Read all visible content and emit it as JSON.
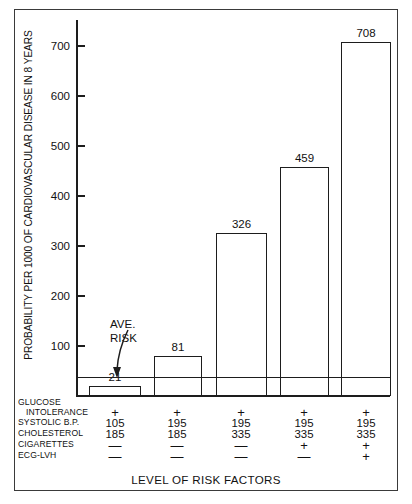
{
  "chart_data": {
    "type": "bar",
    "title": "",
    "ylabel": "PROBABILITY PER 1000 OF CARDIOVASCULAR DISEASE IN 8 YEARS",
    "xlabel": "LEVEL OF RISK FACTORS",
    "categories": [
      "1",
      "2",
      "3",
      "4",
      "5"
    ],
    "values": [
      21,
      81,
      326,
      459,
      708
    ],
    "value_labels": [
      "21",
      "81",
      "326",
      "459",
      "708"
    ],
    "ylim": [
      0,
      730
    ],
    "yticks": [
      100,
      200,
      300,
      400,
      500,
      600,
      700
    ],
    "ytick_labels": [
      "100",
      "200",
      "300",
      "400",
      "500",
      "600",
      "700"
    ],
    "grid": false,
    "legend": "none",
    "annotations": [
      {
        "name": "average-risk",
        "label_line1": "AVE.",
        "label_line2": "RISK",
        "value": 37,
        "style": "horizontal-reference-line-with-arrow"
      }
    ],
    "risk_factor_table": {
      "row_labels": [
        "GLUCOSE",
        "INTOLERANCE",
        "SYSTOLIC B.P.",
        "CHOLESTEROL",
        "CIGARETTES",
        "ECG-LVH"
      ],
      "rows": [
        {
          "label": "INTOLERANCE",
          "values": [
            "+",
            "+",
            "+",
            "+",
            "+"
          ]
        },
        {
          "label": "SYSTOLIC B.P.",
          "values": [
            "105",
            "195",
            "195",
            "195",
            "195"
          ]
        },
        {
          "label": "CHOLESTEROL",
          "values": [
            "185",
            "185",
            "335",
            "335",
            "335"
          ]
        },
        {
          "label": "CIGARETTES",
          "values": [
            "—",
            "—",
            "—",
            "+",
            "+"
          ]
        },
        {
          "label": "ECG-LVH",
          "values": [
            "—",
            "—",
            "—",
            "—",
            "+"
          ]
        }
      ]
    },
    "colors": {
      "bar_fill": "#ffffff",
      "bar_stroke": "#1d1d1d",
      "axis": "#1d1d1d",
      "text": "#111111",
      "frame": "#3a3a3a",
      "background": "#ffffff"
    }
  }
}
